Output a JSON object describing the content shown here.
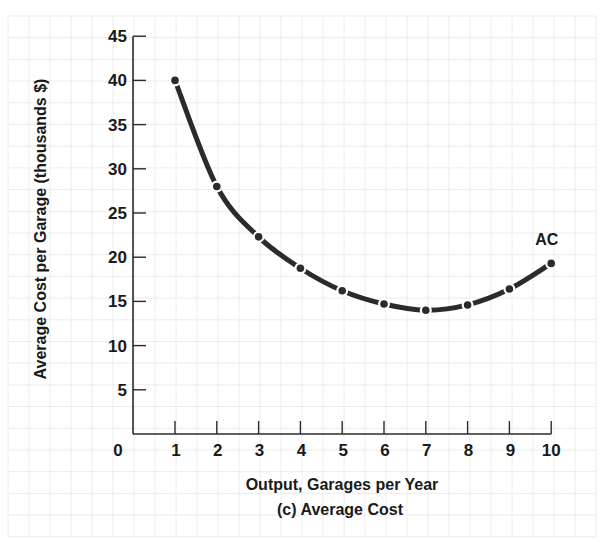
{
  "chart_data": {
    "type": "line",
    "title": "(c) Average Cost",
    "xlabel": "Output, Garages per Year",
    "ylabel": "Average Cost per Garage (thousands $)",
    "x": [
      1,
      2,
      3,
      4,
      5,
      6,
      7,
      8,
      9,
      10
    ],
    "series": [
      {
        "name": "AC",
        "values": [
          40,
          28,
          22.3,
          18.75,
          16.2,
          14.7,
          14,
          14.6,
          16.4,
          19.3
        ]
      }
    ],
    "xticks": [
      0,
      1,
      2,
      3,
      4,
      5,
      6,
      7,
      8,
      9,
      10
    ],
    "yticks": [
      5,
      10,
      15,
      20,
      25,
      30,
      35,
      40,
      45
    ],
    "xlim": [
      0,
      10
    ],
    "ylim": [
      0,
      45
    ],
    "grid": true,
    "legend": "inline label 'AC' at end of curve"
  },
  "colors": {
    "curve": "#2b2b2b",
    "axis": "#2b2b2b",
    "grid": "#ececec",
    "text": "#1a1a1a"
  }
}
